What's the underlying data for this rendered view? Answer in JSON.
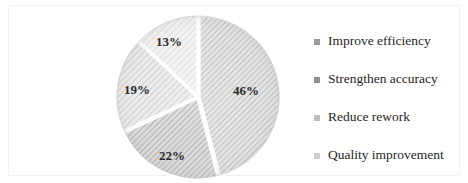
{
  "chart_data": {
    "type": "pie",
    "title": "",
    "categories": [
      "Improve efficiency",
      "Strengthen accuracy",
      "Reduce rework",
      "Quality improvement"
    ],
    "values": [
      46,
      22,
      19,
      13
    ],
    "value_labels": [
      "46%",
      "22%",
      "19%",
      "13%"
    ],
    "units": "percent",
    "legend_position": "right",
    "grid": false,
    "start_angle_deg": 0,
    "direction": "clockwise",
    "slice_colors": [
      "#d9d9d9",
      "#c9c9c9",
      "#e0e0e0",
      "#ededed"
    ],
    "slice_patterns": [
      "diagonal-hatch",
      "diagonal-hatch",
      "diagonal-hatch",
      "diagonal-hatch"
    ],
    "separator_color": "#ffffff"
  },
  "pie": {
    "center_x": 189,
    "center_y": 91,
    "radius": 81,
    "slices": [
      {
        "label": "46%",
        "value": 46,
        "label_x": 237,
        "label_y": 85,
        "fill": "#d9d9d9"
      },
      {
        "label": "22%",
        "value": 22,
        "label_x": 163,
        "label_y": 150,
        "fill": "#c9c9c9"
      },
      {
        "label": "19%",
        "value": 19,
        "label_x": 128,
        "label_y": 84,
        "fill": "#e0e0e0"
      },
      {
        "label": "13%",
        "value": 13,
        "label_x": 160,
        "label_y": 36,
        "fill": "#ededed"
      }
    ]
  },
  "legend": {
    "items": [
      {
        "label": "Improve efficiency",
        "marker_color": "#9a9a9a"
      },
      {
        "label": "Strengthen accuracy",
        "marker_color": "#8f8f8f"
      },
      {
        "label": "Reduce rework",
        "marker_color": "#bdbdbd"
      },
      {
        "label": "Quality improvement",
        "marker_color": "#cfcfcf"
      }
    ]
  },
  "frame": {
    "border_color": "#f2f2f2",
    "background": "#ffffff"
  }
}
